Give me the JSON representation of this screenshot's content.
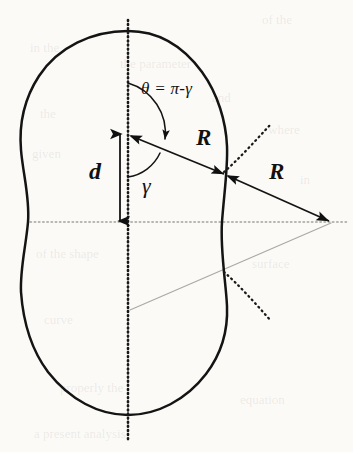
{
  "figure": {
    "domain": "Diagram",
    "canvas": {
      "width": 353,
      "height": 452
    },
    "background_color": "#fbfaf7",
    "ink_color": "#101010",
    "guide_color": "#9b9b96"
  },
  "labels": {
    "theta_equation": "θ = π-γ",
    "distance_d": "d",
    "angle_gamma": "γ",
    "radius_upper": "R",
    "radius_lower": "R"
  },
  "geometry": {
    "symmetry_axis_x": 128,
    "horizontal_axis_y": 222,
    "lobe_center_upper": {
      "x": 128,
      "y": 135
    },
    "lobe_center_lower": {
      "x": 128,
      "y": 309
    },
    "contour_top_y": 31,
    "contour_bottom_y": 415,
    "contour_left_x": 18,
    "waist_left_x": 28,
    "waist_right_x": 222,
    "intersection_point": {
      "x": 226,
      "y": 175
    },
    "apex_point": {
      "x": 330,
      "y": 222
    },
    "d_arrow_x": 120,
    "d_arrow_top_y": 133,
    "d_arrow_bottom_y": 222,
    "radius_R_length_px": 106,
    "theta_arc_radius_px": 52,
    "gamma_arc_radius_px": 42
  },
  "elements": {
    "contour_name": "peanut-contour",
    "vertical_axis_name": "vertical-symmetry-axis",
    "horizontal_axis_name": "horizontal-symmetry-axis",
    "radius_segment_1": "radius-segment-center-to-intersection",
    "radius_segment_2": "radius-segment-intersection-to-apex",
    "guide_line_1": "guide-line-center-to-apex",
    "guide_line_2": "guide-line-lower-to-apex",
    "dotted_arc_upper": "tangent-arc-upper",
    "dotted_arc_lower": "tangent-arc-lower",
    "theta_arc": "theta-angle-arc",
    "gamma_arc": "gamma-angle-arc",
    "d_arrow": "distance-d-arrow"
  },
  "ghost_text": [
    {
      "text": "of the",
      "x": 262,
      "y": 18
    },
    {
      "text": "in the",
      "x": 30,
      "y": 46
    },
    {
      "text": "the parameter",
      "x": 120,
      "y": 62
    },
    {
      "text": "and",
      "x": 212,
      "y": 96
    },
    {
      "text": "the",
      "x": 40,
      "y": 112
    },
    {
      "text": "where",
      "x": 268,
      "y": 128
    },
    {
      "text": "given",
      "x": 32,
      "y": 152
    },
    {
      "text": "in",
      "x": 300,
      "y": 178
    },
    {
      "text": "of the shape",
      "x": 36,
      "y": 252
    },
    {
      "text": "surface",
      "x": 252,
      "y": 262
    },
    {
      "text": "curve",
      "x": 44,
      "y": 318
    },
    {
      "text": "properly the",
      "x": 60,
      "y": 386
    },
    {
      "text": "equation",
      "x": 240,
      "y": 398
    },
    {
      "text": "a present analysis",
      "x": 34,
      "y": 432
    }
  ]
}
